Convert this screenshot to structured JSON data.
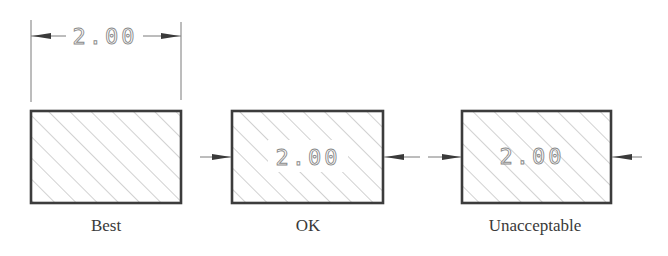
{
  "figure": {
    "colors": {
      "outline": "#3c3c3c",
      "hatch": "#9a9a9a",
      "dimension_text": "#8a8a8a",
      "caption": "#3a3a3a",
      "background": "#ffffff"
    },
    "panels": [
      {
        "id": "best",
        "caption": "Best",
        "dimension_value": "2.00",
        "dimension_placement": "outside-above-with-extension-lines"
      },
      {
        "id": "ok",
        "caption": "OK",
        "dimension_value": "2.00",
        "dimension_placement": "inside-with-hatch-break"
      },
      {
        "id": "unacceptable",
        "caption": "Unacceptable",
        "dimension_value": "2.00",
        "dimension_placement": "inside-over-hatching"
      }
    ]
  }
}
